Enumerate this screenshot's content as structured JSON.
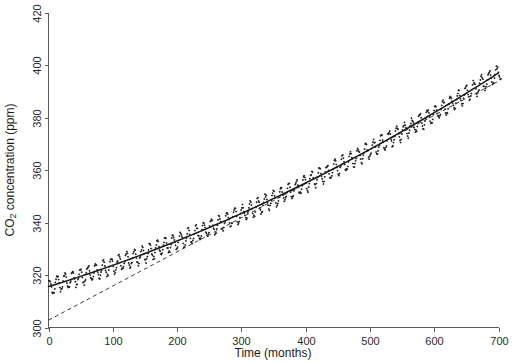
{
  "axes": {
    "y_title": "CO2 concentration (ppm)",
    "y_title_prefix": "CO",
    "y_title_sub": "2",
    "y_title_suffix": " concentration (ppm)",
    "x_title": "Time (months)"
  },
  "chart_data": {
    "type": "scatter",
    "title": "",
    "xlabel": "Time (months)",
    "ylabel": "CO2 concentration (ppm)",
    "xlim": [
      0,
      700
    ],
    "ylim": [
      300,
      420
    ],
    "xticks": [
      0,
      100,
      200,
      300,
      400,
      500,
      600,
      700
    ],
    "yticks": [
      300,
      320,
      340,
      360,
      380,
      400,
      420
    ],
    "grid": false,
    "legend": null,
    "axis_style": "open-frame-left-bottom",
    "series": [
      {
        "name": "observed-monthly-co2",
        "type": "scatter",
        "marker": "dot",
        "color": "#232323",
        "description": "Monthly observed CO2 concentration with seasonal oscillation superimposed on an accelerating upward trend",
        "seasonal_amplitude_ppm": 3.0,
        "seasonal_period_months": 12,
        "trend_model": "quadratic",
        "trend_coefficients": {
          "intercept": 315.6,
          "linear": 0.0755,
          "quadratic": 5.85e-05
        },
        "x_start": 0,
        "x_end": 712,
        "x_step": 1,
        "y_min_observed": 312.5,
        "y_max_observed": 411.0
      },
      {
        "name": "fitted-trend-solid",
        "type": "line",
        "style": "solid",
        "color": "#1a1a1a",
        "description": "Smooth fitted quadratic trend through the monthly observations",
        "trend_coefficients": {
          "intercept": 315.6,
          "linear": 0.0755,
          "quadratic": 5.85e-05
        },
        "y_at_x0": 315.6,
        "y_at_x700": 397.1
      },
      {
        "name": "linear-trend-dashed",
        "type": "line",
        "style": "dashed",
        "color": "#3d3d3d",
        "description": "Straight linear trend line starting below the data at x=0 and crossing the fitted curve near x=560",
        "y_at_x0": 302.8,
        "y_at_x700": 394.0,
        "slope_ppm_per_month": 0.1303
      }
    ],
    "x": [
      0,
      50,
      100,
      150,
      200,
      250,
      300,
      350,
      400,
      450,
      500,
      550,
      600,
      650,
      700
    ],
    "y_fitted_solid": [
      315.6,
      319.5,
      323.7,
      328.2,
      333.0,
      338.2,
      343.6,
      349.4,
      355.5,
      361.9,
      378.0,
      373.7,
      381.1,
      388.9,
      397.1
    ],
    "y_trend_dashed": [
      302.8,
      309.3,
      315.8,
      322.3,
      328.9,
      335.4,
      341.9,
      348.4,
      355.0,
      361.5,
      368.0,
      374.5,
      381.0,
      387.6,
      394.0
    ]
  }
}
